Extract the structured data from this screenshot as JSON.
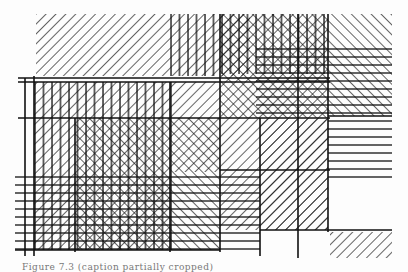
{
  "figure": {
    "type": "hatched-line-composition",
    "stroke_color": "#111111",
    "background_color": "#fdfdfd",
    "caption": "Figure 7.3 (caption partially cropped)"
  },
  "regions": [
    {
      "name": "top-diagonal-band",
      "x": 36,
      "y": 14,
      "w": 214,
      "h": 62,
      "hatch": "forward-diagonal"
    },
    {
      "name": "top-vertical-stripes",
      "x": 170,
      "y": 14,
      "w": 50,
      "h": 62,
      "hatch": "vertical"
    },
    {
      "name": "top-crosshatch",
      "x": 220,
      "y": 14,
      "w": 108,
      "h": 156,
      "hatch": "cross"
    },
    {
      "name": "top-right-backslash",
      "x": 328,
      "y": 14,
      "w": 64,
      "h": 102,
      "hatch": "back-diagonal"
    },
    {
      "name": "right-horizontal-lines",
      "x": 328,
      "y": 48,
      "w": 64,
      "h": 132,
      "hatch": "horizontal"
    },
    {
      "name": "left-diagonal-column",
      "x": 34,
      "y": 82,
      "w": 41,
      "h": 168,
      "hatch": "forward-diagonal"
    },
    {
      "name": "left-vertical-column",
      "x": 34,
      "y": 82,
      "w": 140,
      "h": 168,
      "hatch": "vertical"
    },
    {
      "name": "center-crosshatch",
      "x": 75,
      "y": 118,
      "w": 95,
      "h": 132,
      "hatch": "cross"
    },
    {
      "name": "center-right-diagonal",
      "x": 170,
      "y": 82,
      "w": 50,
      "h": 36,
      "hatch": "forward-diagonal"
    },
    {
      "name": "mid-diagonal",
      "x": 220,
      "y": 118,
      "w": 108,
      "h": 112,
      "hatch": "forward-diagonal"
    },
    {
      "name": "bottom-horizontal-lines",
      "x": 15,
      "y": 172,
      "w": 245,
      "h": 80,
      "hatch": "horizontal"
    },
    {
      "name": "bottom-right-diagonal",
      "x": 330,
      "y": 232,
      "w": 62,
      "h": 26,
      "hatch": "forward-diagonal"
    }
  ]
}
